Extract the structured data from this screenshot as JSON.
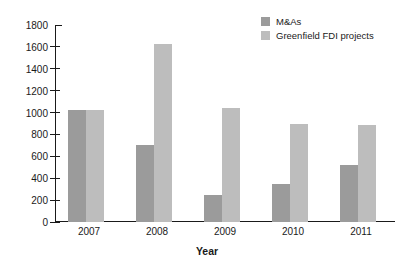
{
  "chart_data": {
    "type": "bar",
    "title": "",
    "subtitle": "",
    "xlabel": "Year",
    "ylabel": "",
    "categories": [
      "2007",
      "2008",
      "2009",
      "2010",
      "2011"
    ],
    "series": [
      {
        "name": "M&As",
        "color": "#9b9b9b",
        "values": [
          1020,
          700,
          250,
          345,
          520
        ]
      },
      {
        "name": "Greenfield FDI projects",
        "color": "#bdbdbd",
        "values": [
          1020,
          1630,
          1040,
          895,
          890
        ]
      }
    ],
    "ylim": [
      0,
      1800
    ],
    "ytick_step": 200,
    "yticks": [
      0,
      200,
      400,
      600,
      800,
      1000,
      1200,
      1400,
      1600,
      1800
    ],
    "ytick_labels": [
      "0",
      "200",
      "400",
      "600",
      "800",
      "1000",
      "1200",
      "1400",
      "1600",
      "1800"
    ],
    "grid": false,
    "legend_position": "top-right",
    "background": "#ffffff",
    "axis_color": "#1a1a1a"
  }
}
